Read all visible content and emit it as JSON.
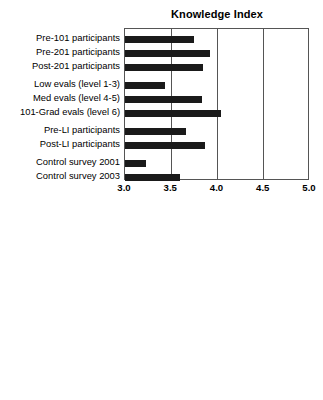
{
  "figure": {
    "categories": [
      "Pre-101 participants",
      "Pre-201 participants",
      "Post-201 participants",
      "Low evals (level 1-3)",
      "Med evals (level 4-5)",
      "101-Grad evals (level 6)",
      "Pre-LI participants",
      "Post-LI participants",
      "Control survey 2001",
      "Control survey 2003"
    ],
    "xticks": [
      "3.0",
      "3.5",
      "4.0",
      "4.5",
      "5.0"
    ],
    "bar_color": "#1a1a1a",
    "axis_color": "#555555"
  },
  "chart_data": [
    {
      "type": "bar",
      "orientation": "horizontal",
      "title": "Knowledge Index",
      "xlabel": "",
      "ylabel": "",
      "xlim": [
        3.0,
        5.0
      ],
      "xticks": [
        3.0,
        3.5,
        4.0,
        4.5,
        5.0
      ],
      "grid": true,
      "legend": "none",
      "categories": [
        "Pre-101 participants",
        "Pre-201 participants",
        "Post-201 participants",
        "Low evals (level 1-3)",
        "Med evals (level 4-5)",
        "101-Grad evals (level 6)",
        "Pre-LI participants",
        "Post-LI participants",
        "Control survey 2001",
        "Control survey 2003"
      ],
      "values": [
        3.75,
        3.92,
        3.84,
        3.43,
        3.83,
        4.04,
        3.66,
        3.87,
        3.23,
        3.59
      ]
    },
    {
      "type": "bar",
      "orientation": "horizontal",
      "title": "Familiarity Index",
      "xlabel": "",
      "ylabel": "",
      "xlim": [
        3.0,
        5.0
      ],
      "xticks": [
        3.0,
        3.5,
        4.0,
        4.5,
        5.0
      ],
      "grid": true,
      "legend": "none",
      "categories": [
        "Pre-101 participants",
        "Pre-201 participants",
        "Post-201 participants",
        "Low evals (level 1-3)",
        "Med evals (level 4-5)",
        "101-Grad evals (level 6)",
        "Pre-LI participants",
        "Post-LI participants",
        "Control survey 2001",
        "Control survey 2003"
      ],
      "values": [
        4.03,
        4.19,
        4.08,
        4.12,
        4.54,
        4.48,
        3.85,
        3.93,
        3.92,
        4.08
      ]
    }
  ]
}
